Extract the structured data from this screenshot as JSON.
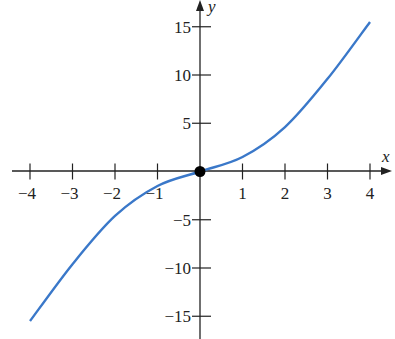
{
  "chart_data": {
    "type": "line",
    "title": "",
    "xlabel": "x",
    "ylabel": "y",
    "xlim": [
      -4.3,
      4.4
    ],
    "ylim": [
      -17,
      18
    ],
    "grid": false,
    "x_ticks": [
      -4,
      -3,
      -2,
      -1,
      1,
      2,
      3,
      4
    ],
    "x_tick_labels": [
      "−4",
      "−3",
      "−2",
      "−1",
      "1",
      "2",
      "3",
      "4"
    ],
    "y_ticks": [
      15,
      10,
      5,
      -5,
      -10,
      -15
    ],
    "y_tick_labels": [
      "15",
      "10",
      "5",
      "−5",
      "−10",
      "−15"
    ],
    "series": [
      {
        "name": "curve",
        "color": "#3a78c9",
        "x": [
          -4,
          -3,
          -2,
          -1,
          0,
          1,
          2,
          3,
          4
        ],
        "y": [
          -15.5,
          -9.6,
          -4.6,
          -1.5,
          0,
          1.5,
          4.6,
          9.6,
          15.5
        ]
      }
    ],
    "annotations": [
      {
        "type": "point",
        "x": 0,
        "y": 0,
        "color": "#000000",
        "label": ""
      }
    ]
  },
  "axes": {
    "x_label": "x",
    "y_label": "y"
  }
}
